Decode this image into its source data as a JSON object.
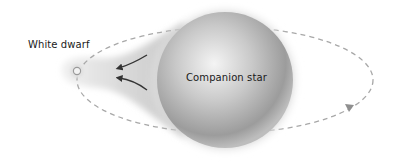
{
  "diagram": {
    "labels": {
      "white_dwarf": "White dwarf",
      "companion_star": "Companion star"
    },
    "elements": {
      "orbit": {
        "style": "dashed",
        "direction": "counter-clockwise",
        "color": "#a8a8a8"
      },
      "accretion_stream": {
        "from": "Companion star",
        "to": "White dwarf",
        "arrow_count": 2,
        "arrow_color": "#333333"
      },
      "companion_star": {
        "shape": "sphere",
        "color": "#9a9a9a"
      },
      "white_dwarf": {
        "shape": "small-sphere",
        "color": "#d8d8d8"
      }
    }
  }
}
